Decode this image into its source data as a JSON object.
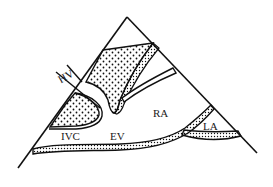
{
  "diagram": {
    "type": "anatomical schematic",
    "labels": {
      "hv": "HV",
      "ivc": "IVC",
      "ev": "EV",
      "ra": "RA",
      "la": "LA"
    },
    "colors": {
      "line": "#111111",
      "background": "#ffffff",
      "stipple": "#111111"
    }
  }
}
